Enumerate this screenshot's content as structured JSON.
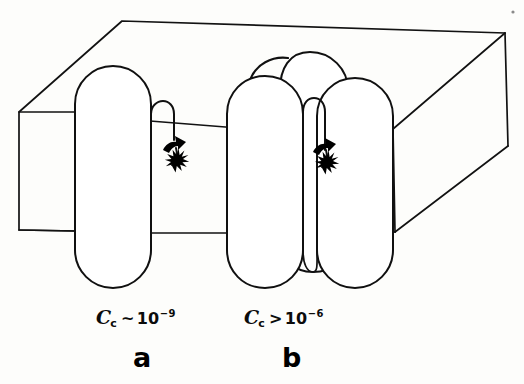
{
  "figure": {
    "kind": "line-drawing-diagram",
    "background_color": "#fdfdfb",
    "ink_color": "#101010"
  },
  "panels": [
    {
      "id": "a",
      "letter": "a",
      "formula": {
        "symbol": "C",
        "subscript": "c",
        "relation": "~",
        "base": "10",
        "exponent": "−9",
        "full_text": "C_c ~ 10⁻⁹"
      },
      "description": "single capsule-shaped protein spanning the membrane slab",
      "capsule_count": 1,
      "has_loop": true,
      "has_arrow": true,
      "has_starburst": true,
      "has_top_arc": false
    },
    {
      "id": "b",
      "letter": "b",
      "formula": {
        "symbol": "C",
        "subscript": "c",
        "relation": ">",
        "base": "10",
        "exponent": "−6",
        "full_text": "C_c > 10⁻⁶"
      },
      "description": "cluster of three overlapping capsule-shaped proteins spanning the membrane slab",
      "capsule_count": 3,
      "has_loop": true,
      "has_arrow": true,
      "has_starburst": true,
      "has_top_arc": true
    }
  ],
  "elements": {
    "membrane_slab_label": "membrane slab drawn in oblique 3D perspective",
    "starburst_label": "starburst mark (active site)",
    "arrow_label": "curved arrow indicating motion into the membrane",
    "loop_label": "hairpin loop extending from the protein",
    "speck_label": "scan artifact speck"
  }
}
